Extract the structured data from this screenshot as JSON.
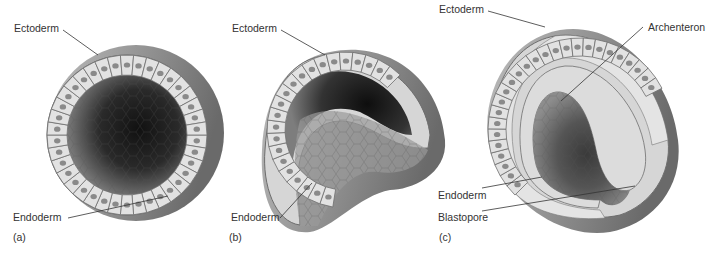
{
  "figure": {
    "colors": {
      "background": "#ffffff",
      "cell_fill": "#e2e2e2",
      "cell_border": "#6e6e6e",
      "nucleus": "#8a8a8a",
      "cavity_dark": "#1c1c1c",
      "outer_shell": "#9a9a9a",
      "leader_line": "#333333",
      "label_text": "#333333"
    },
    "panels": [
      {
        "id": "a",
        "panel_label": "(a)",
        "labels": {
          "ectoderm": "Ectoderm",
          "endoderm": "Endoderm"
        }
      },
      {
        "id": "b",
        "panel_label": "(b)",
        "labels": {
          "ectoderm": "Ectoderm",
          "endoderm": "Endoderm"
        }
      },
      {
        "id": "c",
        "panel_label": "(c)",
        "labels": {
          "ectoderm": "Ectoderm",
          "archenteron": "Archenteron",
          "endoderm": "Endoderm",
          "blastopore": "Blastopore"
        }
      }
    ]
  }
}
